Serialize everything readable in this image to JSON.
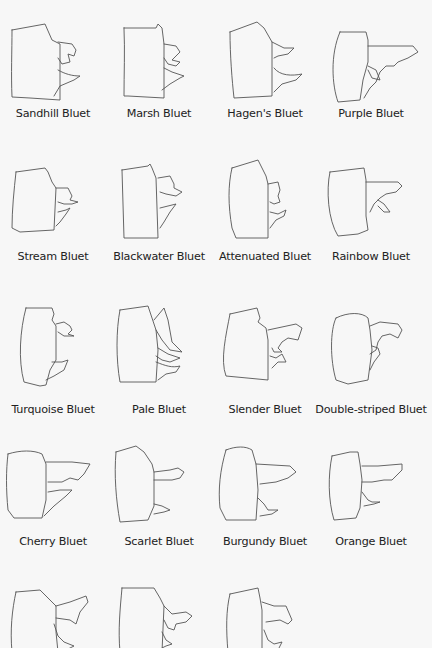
{
  "species": [
    {
      "name": "Sandhill Bluet"
    },
    {
      "name": "Marsh Bluet"
    },
    {
      "name": "Hagen's Bluet"
    },
    {
      "name": "Purple Bluet"
    },
    {
      "name": "Stream Bluet"
    },
    {
      "name": "Blackwater Bluet"
    },
    {
      "name": "Attenuated Bluet"
    },
    {
      "name": "Rainbow Bluet"
    },
    {
      "name": "Turquoise Bluet"
    },
    {
      "name": "Pale Bluet"
    },
    {
      "name": "Slender Bluet"
    },
    {
      "name": "Double-striped Bluet"
    },
    {
      "name": "Cherry Bluet"
    },
    {
      "name": "Scarlet Bluet"
    },
    {
      "name": "Burgundy Bluet"
    },
    {
      "name": "Orange Bluet"
    },
    {
      "name": ""
    },
    {
      "name": ""
    },
    {
      "name": ""
    }
  ]
}
